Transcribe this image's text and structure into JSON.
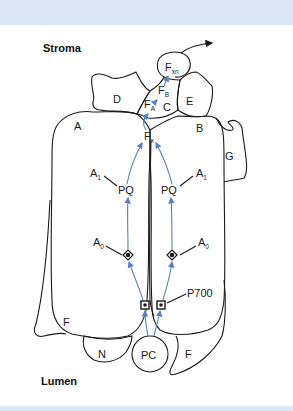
{
  "diagram": {
    "title_regions": {
      "top": "Stroma",
      "bottom": "Lumen"
    },
    "subunits": [
      "A",
      "B",
      "C",
      "D",
      "E",
      "F",
      "G",
      "K",
      "N"
    ],
    "cofactors": {
      "fx_main": "F",
      "fx_sub": "x",
      "fa_main": "F",
      "fa_sub": "A",
      "fb_main": "F",
      "fb_sub": "B",
      "fxn_main": "F",
      "fxn_sub": "xn",
      "pq_left": "PQ",
      "pq_right": "PQ",
      "a1_left_main": "A",
      "a1_left_sub": "1",
      "a1_right_main": "A",
      "a1_right_sub": "1",
      "a0_left_main": "A",
      "a0_left_sub": "0",
      "a0_right_main": "A",
      "a0_right_sub": "0",
      "p700": "P700",
      "pc": "PC"
    },
    "colors": {
      "band": "#dde7f3",
      "outline": "#1a1a1a",
      "electron_path": "#5a7fc0"
    }
  }
}
